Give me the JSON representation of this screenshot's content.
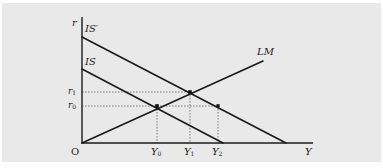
{
  "diagram": {
    "colors": {
      "background": "#e9e9e9",
      "line": "#1a1a1a",
      "guide": "#555555"
    },
    "axes": {
      "y_label": "r",
      "x_label": "Y",
      "origin_label": "O"
    },
    "curves": {
      "is_prime": {
        "label": "IS′",
        "x1": 82,
        "y1": 37,
        "x2": 286,
        "y2": 143
      },
      "is": {
        "label": "IS",
        "x1": 82,
        "y1": 69,
        "x2": 223,
        "y2": 143
      },
      "lm": {
        "label": "LM",
        "x1": 82,
        "y1": 143,
        "x2": 263,
        "y2": 61
      }
    },
    "y_ticks": [
      {
        "base": "r",
        "sub": "1",
        "y": 92
      },
      {
        "base": "r",
        "sub": "0",
        "y": 106
      }
    ],
    "x_ticks": [
      {
        "base": "Y",
        "sub": "0",
        "x": 157
      },
      {
        "base": "Y",
        "sub": "1",
        "x": 190
      },
      {
        "base": "Y",
        "sub": "2",
        "x": 218
      }
    ],
    "points": [
      {
        "name": "E0",
        "x": 157,
        "y": 106
      },
      {
        "name": "E1",
        "x": 190,
        "y": 92
      },
      {
        "name": "E2",
        "x": 218,
        "y": 106
      }
    ]
  }
}
